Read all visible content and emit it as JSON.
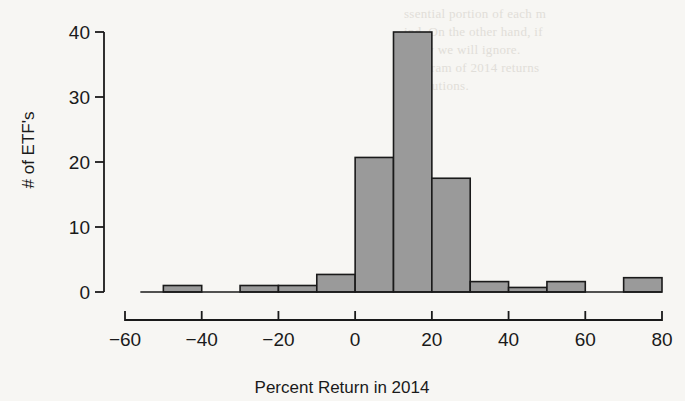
{
  "chart_data": {
    "type": "bar",
    "title": "",
    "xlabel": "Percent Return in 2014",
    "ylabel": "# of ETF's",
    "xlim": [
      -60,
      80
    ],
    "ylim": [
      0,
      40
    ],
    "xticks": [
      -60,
      -40,
      -20,
      0,
      20,
      40,
      60,
      80
    ],
    "xtick_labels": [
      "−60",
      "−40",
      "−20",
      "0",
      "20",
      "40",
      "60",
      "80"
    ],
    "yticks": [
      0,
      10,
      20,
      30,
      40
    ],
    "ytick_labels": [
      "0",
      "10",
      "20",
      "30",
      "40"
    ],
    "grid": false,
    "legend": null,
    "bin_width": 10,
    "bins": [
      {
        "left": -50,
        "right": -40,
        "value": 1
      },
      {
        "left": -40,
        "right": -30,
        "value": 0
      },
      {
        "left": -30,
        "right": -20,
        "value": 1
      },
      {
        "left": -20,
        "right": -10,
        "value": 1
      },
      {
        "left": -10,
        "right": 0,
        "value": 2.7
      },
      {
        "left": 0,
        "right": 10,
        "value": 20.7
      },
      {
        "left": 10,
        "right": 20,
        "value": 40
      },
      {
        "left": 20,
        "right": 30,
        "value": 17.5
      },
      {
        "left": 30,
        "right": 40,
        "value": 1.6
      },
      {
        "left": 40,
        "right": 50,
        "value": 0.7
      },
      {
        "left": 50,
        "right": 60,
        "value": 1.6
      },
      {
        "left": 60,
        "right": 70,
        "value": 0
      },
      {
        "left": 70,
        "right": 80,
        "value": 2.2
      }
    ],
    "colors": {
      "bar_fill": "#9a9a9a",
      "bar_stroke": "#1a1a1a",
      "axis": "#1a1a1a",
      "background": "#f7f6f3"
    }
  },
  "page_bleed": [
    {
      "text": "ssential portion of each m",
      "x": 404,
      "y": 6
    },
    {
      "text": "ind. On the other hand, if",
      "x": 404,
      "y": 24
    },
    {
      "text": "many we will ignore.",
      "x": 404,
      "y": 42
    },
    {
      "text": "istogram of 2014 returns",
      "x": 404,
      "y": 60
    },
    {
      "text": "institutions.",
      "x": 404,
      "y": 78
    }
  ]
}
